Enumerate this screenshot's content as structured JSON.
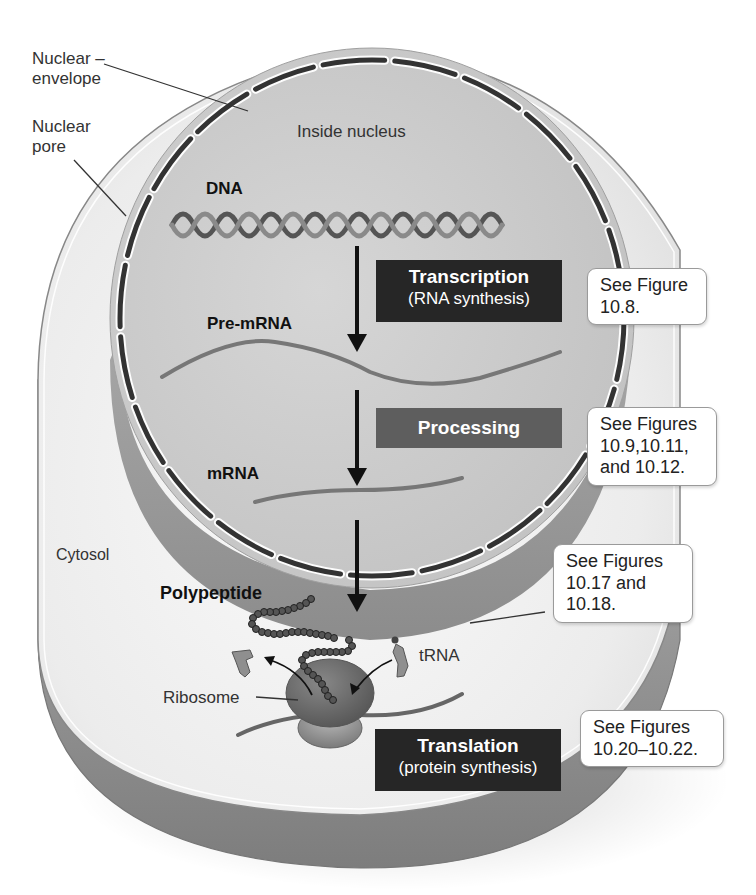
{
  "figure": {
    "colors": {
      "cytosol_face": "#ececec",
      "cell_side": "#9a9a9a",
      "nucleus_face": "#c9c9c9",
      "nucleus_side": "#8f8f8f",
      "envelope_segment": "#333333",
      "transcription_box": "#262626",
      "processing_box": "#5e5e5e",
      "translation_box": "#262626",
      "ribosome": "#6a6a6a",
      "ribosome_small": "#8a8a8a"
    }
  },
  "labels": {
    "nuclear_envelope": [
      "Nuclear",
      "envelope"
    ],
    "nuclear_pore": [
      "Nuclear",
      "pore"
    ],
    "inside_nucleus": "Inside nucleus",
    "dna": "DNA",
    "pre_mrna": "Pre-mRNA",
    "mrna": "mRNA",
    "cytosol": "Cytosol",
    "polypeptide": "Polypeptide",
    "trna": "tRNA",
    "ribosome": "Ribosome"
  },
  "steps": [
    {
      "title": "Transcription",
      "subtitle": "(RNA synthesis)",
      "callout": [
        "See Figure",
        "10.8."
      ]
    },
    {
      "title": "Processing",
      "subtitle": "",
      "callout": [
        "See Figures",
        "10.9,10.11,",
        "and 10.12."
      ]
    },
    {
      "title": "Translation",
      "subtitle": "(protein synthesis)",
      "callout": [
        "See Figures",
        "10.20–10.22."
      ]
    }
  ],
  "trna_callout": [
    "See Figures",
    "10.17 and",
    "10.18."
  ]
}
